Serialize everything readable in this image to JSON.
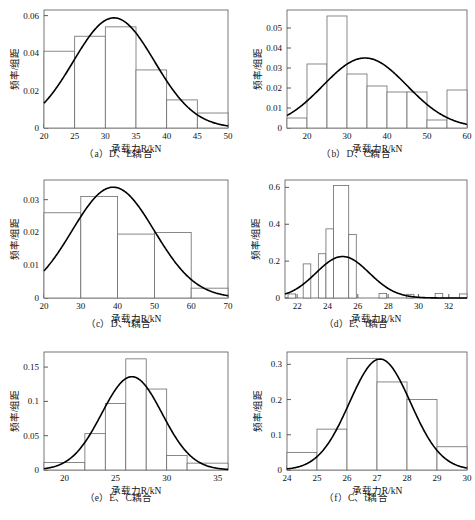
{
  "figure": {
    "axis_x_label": "承载力R/kN",
    "axis_y_label": "频率/组距"
  },
  "panels": [
    {
      "key": "a",
      "caption": "（a）D、E耦合"
    },
    {
      "key": "b",
      "caption": "（b）D、C耦合"
    },
    {
      "key": "c",
      "caption": "（c）D、t耦合"
    },
    {
      "key": "d",
      "caption": "（d）E、t耦合"
    },
    {
      "key": "e",
      "caption": "（e）E、C耦合"
    },
    {
      "key": "f",
      "caption": "（f）C、t耦合"
    }
  ],
  "chart_data": [
    {
      "type": "bar",
      "panel": "a",
      "title": "（a）D、E耦合",
      "xlabel": "承载力R/kN",
      "ylabel": "频率/组距",
      "xlim": [
        20,
        50
      ],
      "ylim": [
        0,
        0.063
      ],
      "xticks": [
        20,
        25,
        30,
        35,
        40,
        45,
        50
      ],
      "yticks": [
        0,
        0.02,
        0.04,
        0.06
      ],
      "ytick_labels": [
        "0",
        "0.02",
        "0.04",
        "0.06"
      ],
      "grid": false,
      "legend": "none",
      "bin_edges": [
        20,
        25,
        30,
        35,
        40,
        45,
        50
      ],
      "values": [
        0.041,
        0.049,
        0.054,
        0.031,
        0.015,
        0.008
      ],
      "curve": {
        "name": "normal-fit",
        "mu": 31.4,
        "sigma": 6.6,
        "peak": 0.0588,
        "y_start": 0.0135,
        "y_end": 0.0012
      }
    },
    {
      "type": "bar",
      "panel": "b",
      "title": "（b）D、C耦合",
      "xlabel": "承载力R/kN",
      "ylabel": "频率/组距",
      "xlim": [
        15,
        60
      ],
      "ylim": [
        0,
        0.059
      ],
      "xticks": [
        20,
        30,
        40,
        50,
        60
      ],
      "yticks": [
        0,
        0.01,
        0.02,
        0.03,
        0.04,
        0.05
      ],
      "ytick_labels": [
        "0",
        "0.01",
        "0.02",
        "0.03",
        "0.04",
        "0.05"
      ],
      "grid": false,
      "legend": "none",
      "bin_edges": [
        15,
        20,
        25,
        30,
        35,
        40,
        45,
        50,
        55,
        60
      ],
      "values": [
        0.005,
        0.032,
        0.056,
        0.027,
        0.021,
        0.018,
        0.018,
        0.004,
        0.019
      ],
      "curve": {
        "name": "normal-fit",
        "mu": 34.5,
        "sigma": 10.5,
        "peak": 0.035,
        "y_start": 0.0075,
        "y_end": 0.0022
      }
    },
    {
      "type": "bar",
      "panel": "c",
      "title": "（c）D、t耦合",
      "xlabel": "承载力R/kN",
      "ylabel": "频率/组距",
      "xlim": [
        20,
        70
      ],
      "ylim": [
        0,
        0.036
      ],
      "xticks": [
        20,
        30,
        40,
        50,
        60,
        70
      ],
      "yticks": [
        0,
        0.01,
        0.02,
        0.03
      ],
      "ytick_labels": [
        "0",
        "0.01",
        "0.02",
        "0.03"
      ],
      "grid": false,
      "legend": "none",
      "bin_edges": [
        20,
        30,
        40,
        50,
        60,
        70
      ],
      "values": [
        0.026,
        0.031,
        0.0195,
        0.02,
        0.003
      ],
      "curve": {
        "name": "normal-fit",
        "mu": 38.8,
        "sigma": 11.2,
        "peak": 0.0338,
        "y_start": 0.0095,
        "y_end": 0.0008
      }
    },
    {
      "type": "bar",
      "panel": "d",
      "title": "（d）E、t耦合",
      "xlabel": "承载力R/kN",
      "ylabel": "频率/组距",
      "xlim": [
        21.2,
        33.2
      ],
      "ylim": [
        0,
        0.64
      ],
      "xticks": [
        22,
        24,
        26,
        28,
        30,
        32
      ],
      "yticks": [
        0,
        0.2,
        0.4,
        0.6
      ],
      "ytick_labels": [
        "0",
        "0.2",
        "0.4",
        "0.6"
      ],
      "grid": false,
      "legend": "none",
      "bin_edges": [
        21.4,
        21.9,
        22.4,
        22.9,
        23.4,
        23.9,
        24.4,
        24.9,
        25.4,
        25.9,
        26.4,
        27.4,
        27.9,
        29.4,
        29.9,
        31.4,
        31.9,
        32.9,
        33.2
      ],
      "values": [
        0.022,
        0,
        0.185,
        0,
        0.24,
        0.375,
        0.61,
        0.345,
        0,
        0,
        0.025,
        0,
        0.018,
        0,
        0.025,
        0,
        0,
        0.022
      ],
      "bars": [
        {
          "x0": 21.4,
          "x1": 21.9,
          "h": 0.022
        },
        {
          "x0": 22.4,
          "x1": 22.9,
          "h": 0.185
        },
        {
          "x0": 23.4,
          "x1": 23.9,
          "h": 0.24
        },
        {
          "x0": 23.9,
          "x1": 24.4,
          "h": 0.375
        },
        {
          "x0": 24.4,
          "x1": 25.4,
          "h": 0.61
        },
        {
          "x0": 25.4,
          "x1": 25.9,
          "h": 0.345
        },
        {
          "x0": 27.4,
          "x1": 27.9,
          "h": 0.025
        },
        {
          "x0": 29.2,
          "x1": 29.7,
          "h": 0.02
        },
        {
          "x0": 31.1,
          "x1": 31.6,
          "h": 0.025
        },
        {
          "x0": 32.7,
          "x1": 33.2,
          "h": 0.022
        }
      ],
      "curve": {
        "name": "normal-fit",
        "mu": 25.0,
        "sigma": 1.75,
        "peak": 0.225,
        "y_start": 0.028,
        "y_end": 0.001
      }
    },
    {
      "type": "bar",
      "panel": "e",
      "title": "（e）E、C耦合",
      "xlabel": "承载力R/kN",
      "ylabel": "频率/组距",
      "xlim": [
        18,
        36
      ],
      "ylim": [
        0,
        0.172
      ],
      "xticks": [
        20,
        25,
        30,
        35
      ],
      "yticks": [
        0,
        0.05,
        0.1,
        0.15
      ],
      "ytick_labels": [
        "0",
        "0.05",
        "0.1",
        "0.15"
      ],
      "grid": false,
      "legend": "none",
      "bin_edges": [
        18,
        22,
        24,
        26,
        28,
        30,
        32,
        36
      ],
      "values": [
        0.011,
        0.053,
        0.097,
        0.162,
        0.118,
        0.021,
        0.01
      ],
      "curve": {
        "name": "normal-fit",
        "mu": 26.6,
        "sigma": 2.95,
        "peak": 0.136,
        "y_start": 0.002,
        "y_end": 0.003
      }
    },
    {
      "type": "bar",
      "panel": "f",
      "title": "（f）C、t耦合",
      "xlabel": "承载力R/kN",
      "ylabel": "频率/组距",
      "xlim": [
        24,
        30
      ],
      "ylim": [
        0,
        0.335
      ],
      "xticks": [
        24,
        25,
        26,
        27,
        28,
        29,
        30
      ],
      "yticks": [
        0,
        0.1,
        0.2,
        0.3
      ],
      "ytick_labels": [
        "0",
        "0.1",
        "0.2",
        "0.3"
      ],
      "grid": false,
      "legend": "none",
      "bin_edges": [
        24,
        25,
        26,
        27,
        28,
        29,
        30
      ],
      "values": [
        0.05,
        0.116,
        0.317,
        0.25,
        0.2,
        0.066
      ],
      "curve": {
        "name": "normal-fit",
        "mu": 27.1,
        "sigma": 1.02,
        "peak": 0.315,
        "y_start": 0.014,
        "y_end": 0.018
      }
    }
  ]
}
